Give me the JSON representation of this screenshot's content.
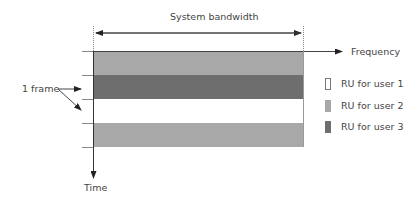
{
  "diagram": {
    "bandwidth_label": "System bandwidth",
    "frequency_label": "Frequency",
    "time_label": "Time",
    "frame_label": "1 frame",
    "bands": [
      {
        "user": "user 2",
        "color": "#a8a8a8"
      },
      {
        "user": "user 3",
        "color": "#6e6e6e"
      },
      {
        "user": "user 1",
        "color": "#ffffff"
      },
      {
        "user": "user 2",
        "color": "#a8a8a8"
      }
    ],
    "legend": [
      {
        "label": "RU for user 1",
        "color": "#ffffff"
      },
      {
        "label": "RU for user 2",
        "color": "#a8a8a8"
      },
      {
        "label": "RU for user 3",
        "color": "#6e6e6e"
      }
    ]
  }
}
